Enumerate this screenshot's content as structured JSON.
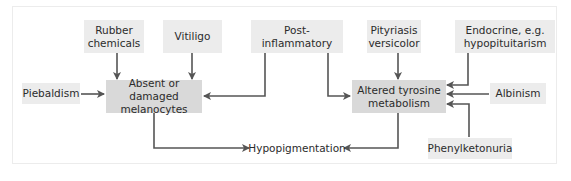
{
  "diagram": {
    "nodes": {
      "rubber": "Rubber chemicals",
      "rubber_l1": "Rubber",
      "rubber_l2": "chemicals",
      "vitiligo": "Vitiligo",
      "postinfl": "Post-inflammatory",
      "pity_l1": "Pityriasis",
      "pity_l2": "versicolor",
      "endo_l1": "Endocrine, e.g.",
      "endo_l2": "hypopituitarism",
      "piebaldism": "Piebaldism",
      "absent_l1": "Absent or damaged",
      "absent_l2": "melanocytes",
      "altered_l1": "Altered tyrosine",
      "altered_l2": "metabolism",
      "albinism": "Albinism",
      "hypo": "Hypopigmentation",
      "pku": "Phenylketonuria"
    },
    "edges": [
      {
        "from": "Rubber chemicals",
        "to": "Absent or damaged melanocytes"
      },
      {
        "from": "Vitiligo",
        "to": "Absent or damaged melanocytes"
      },
      {
        "from": "Post-inflammatory",
        "to": "Absent or damaged melanocytes"
      },
      {
        "from": "Post-inflammatory",
        "to": "Altered tyrosine metabolism"
      },
      {
        "from": "Piebaldism",
        "to": "Absent or damaged melanocytes"
      },
      {
        "from": "Pityriasis versicolor",
        "to": "Altered tyrosine metabolism"
      },
      {
        "from": "Endocrine, e.g. hypopituitarism",
        "to": "Altered tyrosine metabolism"
      },
      {
        "from": "Albinism",
        "to": "Altered tyrosine metabolism"
      },
      {
        "from": "Phenylketonuria",
        "to": "Altered tyrosine metabolism"
      },
      {
        "from": "Absent or damaged melanocytes",
        "to": "Hypopigmentation"
      },
      {
        "from": "Altered tyrosine metabolism",
        "to": "Hypopigmentation"
      }
    ],
    "colors": {
      "light_box": "#ececec",
      "dark_box": "#d9d9d9",
      "arrow": "#555555",
      "text": "#2b2b2b"
    }
  }
}
